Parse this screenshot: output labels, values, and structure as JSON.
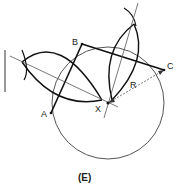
{
  "figure": {
    "caption": "(E)",
    "points": {
      "A": {
        "label": "A",
        "x": 51,
        "y": 113
      },
      "B": {
        "label": "B",
        "x": 82,
        "y": 44
      },
      "C": {
        "label": "C",
        "x": 164,
        "y": 70
      },
      "X": {
        "label": "X",
        "x": 108,
        "y": 103
      }
    },
    "radius_label": "R"
  }
}
